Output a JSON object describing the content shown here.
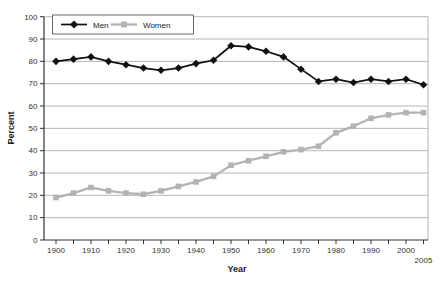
{
  "chart_data": {
    "type": "line",
    "title": "",
    "xlabel": "Year",
    "ylabel": "Percent",
    "x": [
      1900,
      1905,
      1910,
      1915,
      1920,
      1925,
      1930,
      1935,
      1940,
      1945,
      1950,
      1955,
      1960,
      1965,
      1970,
      1975,
      1980,
      1985,
      1990,
      1995,
      2000,
      2005
    ],
    "series": [
      {
        "name": "Men",
        "marker": "diamond",
        "color": "#111111",
        "line_width": 1.7,
        "values": [
          80,
          81,
          82,
          80,
          78.5,
          77,
          76,
          77,
          79,
          80.5,
          87,
          86.5,
          84.5,
          82,
          76.5,
          71,
          72,
          70.5,
          72,
          71,
          72,
          69.5
        ]
      },
      {
        "name": "Women",
        "marker": "square",
        "color": "#b3b3b3",
        "line_width": 2.3,
        "values": [
          19,
          21,
          23.5,
          22,
          21,
          20.5,
          22,
          24,
          26,
          28.5,
          33.5,
          35.5,
          37.5,
          39.5,
          40.5,
          42,
          48,
          51,
          54.5,
          56,
          57,
          57
        ]
      }
    ],
    "ylim": [
      0,
      100
    ],
    "y_ticks": [
      0,
      10,
      20,
      30,
      40,
      50,
      60,
      70,
      80,
      90,
      100
    ],
    "x_minor_tick_step": 5,
    "x_tick_labels": [
      "1900",
      "1910",
      "1920",
      "1930",
      "1940",
      "1950",
      "1960",
      "1970",
      "1980",
      "1990",
      "2000"
    ],
    "x_last_label": "2005",
    "grid": "horizontal",
    "legend_position": "top-left-inside",
    "colors": {
      "background": "#ffffff",
      "grid": "#a3a3a3",
      "plot_border": "#a3a3a3",
      "axis": "#333333",
      "tick_text": "#333333",
      "legend_border": "#595959"
    }
  }
}
